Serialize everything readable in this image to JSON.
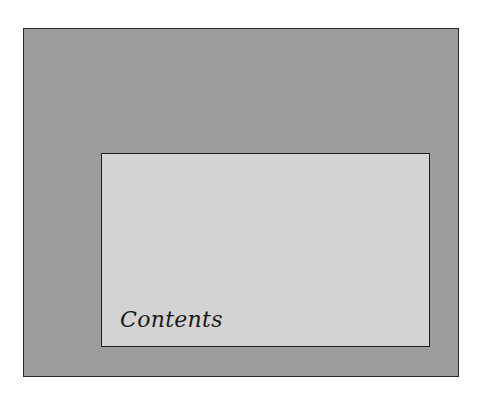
{
  "diagram": {
    "outer_box": {
      "label": "",
      "fill_color": "#9c9c9c",
      "border_color": "#2a2a2a"
    },
    "inner_box": {
      "label": "Contents",
      "fill_color": "#d3d3d3",
      "border_color": "#1e1e1e"
    }
  }
}
